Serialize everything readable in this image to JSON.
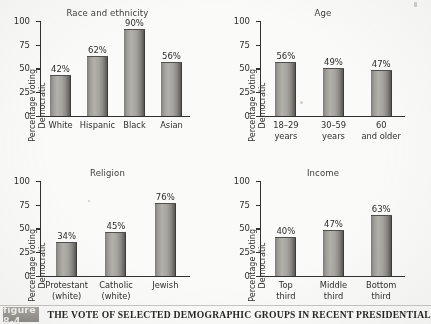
{
  "figure": {
    "badge": "figure 8-4",
    "caption": "THE VOTE OF SELECTED DEMOGRAPHIC GROUPS IN RECENT PRESIDENTIAL"
  },
  "axis": {
    "y_label_line1": "Percentage voting",
    "y_label_line2": "Democratic",
    "ticks": [
      "100",
      "75",
      "50",
      "25",
      "0"
    ]
  },
  "chart_data": [
    {
      "type": "bar",
      "title": "Race and ethnicity",
      "xlabel": "",
      "ylabel": "Percentage voting Democratic",
      "ylim": [
        0,
        100
      ],
      "yticks": [
        0,
        25,
        50,
        75,
        100
      ],
      "grid": false,
      "legend": "none",
      "categories": [
        "White",
        "Hispanic",
        "Black",
        "Asian"
      ],
      "category_lines": [
        [
          "White",
          ""
        ],
        [
          "Hispanic",
          ""
        ],
        [
          "Black",
          ""
        ],
        [
          "Asian",
          ""
        ]
      ],
      "values": [
        42,
        62,
        90,
        56
      ],
      "value_labels": [
        "42%",
        "62%",
        "90%",
        "56%"
      ]
    },
    {
      "type": "bar",
      "title": "Age",
      "xlabel": "",
      "ylabel": "Percentage voting Democratic",
      "ylim": [
        0,
        100
      ],
      "yticks": [
        0,
        25,
        50,
        75,
        100
      ],
      "grid": false,
      "legend": "none",
      "categories": [
        "18–29 years",
        "30–59 years",
        "60 and older"
      ],
      "category_lines": [
        [
          "18–29",
          "years"
        ],
        [
          "30–59",
          "years"
        ],
        [
          "60",
          "and older"
        ]
      ],
      "values": [
        56,
        49,
        47
      ],
      "value_labels": [
        "56%",
        "49%",
        "47%"
      ]
    },
    {
      "type": "bar",
      "title": "Religion",
      "xlabel": "",
      "ylabel": "Percentage voting Democratic",
      "ylim": [
        0,
        100
      ],
      "yticks": [
        0,
        25,
        50,
        75,
        100
      ],
      "grid": false,
      "legend": "none",
      "categories": [
        "Protestant (white)",
        "Catholic (white)",
        "Jewish"
      ],
      "category_lines": [
        [
          "Protestant",
          "(white)"
        ],
        [
          "Catholic",
          "(white)"
        ],
        [
          "Jewish",
          ""
        ]
      ],
      "values": [
        34,
        45,
        76
      ],
      "value_labels": [
        "34%",
        "45%",
        "76%"
      ]
    },
    {
      "type": "bar",
      "title": "Income",
      "xlabel": "",
      "ylabel": "Percentage voting Democratic",
      "ylim": [
        0,
        100
      ],
      "yticks": [
        0,
        25,
        50,
        75,
        100
      ],
      "grid": false,
      "legend": "none",
      "categories": [
        "Top third",
        "Middle third",
        "Bottom third"
      ],
      "category_lines": [
        [
          "Top",
          "third"
        ],
        [
          "Middle",
          "third"
        ],
        [
          "Bottom",
          "third"
        ]
      ],
      "values": [
        40,
        47,
        63
      ],
      "value_labels": [
        "40%",
        "47%",
        "63%"
      ]
    }
  ]
}
